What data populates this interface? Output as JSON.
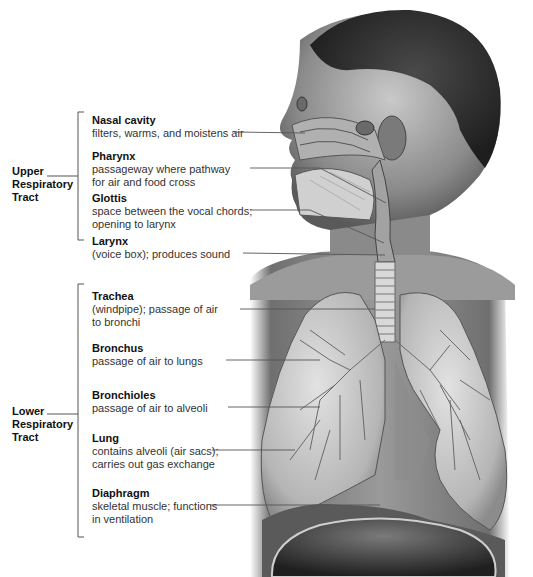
{
  "figure": {
    "groups": [
      {
        "label": "Upper\nRespiratory\nTract",
        "bracket_top": 112,
        "bracket_bottom": 240
      },
      {
        "label": "Lower\nRespiratory\nTract",
        "bracket_top": 284,
        "bracket_bottom": 537
      }
    ],
    "upper": [
      {
        "title": "Nasal cavity",
        "desc": "filters, warms, and moistens air"
      },
      {
        "title": "Pharynx",
        "desc": "passageway where pathway\nfor air and food cross"
      },
      {
        "title": "Glottis",
        "desc": "space between the vocal chords;\nopening to larynx"
      },
      {
        "title": "Larynx",
        "desc": "(voice box); produces sound"
      }
    ],
    "lower": [
      {
        "title": "Trachea",
        "desc": "(windpipe); passage of air\nto bronchi"
      },
      {
        "title": "Bronchus",
        "desc": "passage of air to lungs"
      },
      {
        "title": "Bronchioles",
        "desc": "passage of air to alveoli"
      },
      {
        "title": "Lung",
        "desc": "contains alveoli (air sacs);\ncarries out gas exchange"
      },
      {
        "title": "Diaphragm",
        "desc": "skeletal muscle; functions\nin ventilation"
      }
    ],
    "colors": {
      "line": "#555555",
      "text": "#111111"
    }
  }
}
